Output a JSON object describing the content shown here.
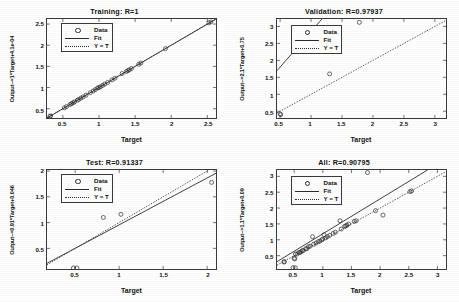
{
  "figure": {
    "background_color": "#ffffff",
    "axis_color": "#3a3a3a",
    "marker_color": "#2b2b2b"
  },
  "legend_labels": {
    "data": "Data",
    "fit": "Fit",
    "yt": "Y = T"
  },
  "chart_data": [
    {
      "type": "scatter",
      "title": "Training:  R=1",
      "xlabel": "Target",
      "ylabel": "Output~=1*Target+4.1e-04",
      "xlim": [
        0.28,
        2.62
      ],
      "ylim": [
        0.28,
        2.62
      ],
      "xticks": [
        0.5,
        1,
        1.5,
        2,
        2.5
      ],
      "xticklabels": [
        "0.5",
        "1",
        "1.5",
        "2",
        "2.5"
      ],
      "yticks": [
        0.5,
        1,
        1.5,
        2,
        2.5
      ],
      "yticklabels": [
        "0.5",
        "1",
        "1.5",
        "2",
        "2.5"
      ],
      "grid": false,
      "legend_position": "upper-left",
      "legend": [
        "Data",
        "Fit",
        "Y = T"
      ],
      "fit_line": {
        "slope": 1.0,
        "intercept": 0.00041,
        "style": "solid"
      },
      "identity_line": {
        "slope": 1.0,
        "intercept": 0.0,
        "style": "dotted"
      },
      "points": [
        [
          0.32,
          0.32
        ],
        [
          0.33,
          0.33
        ],
        [
          0.52,
          0.52
        ],
        [
          0.55,
          0.55
        ],
        [
          0.6,
          0.6
        ],
        [
          0.62,
          0.62
        ],
        [
          0.64,
          0.64
        ],
        [
          0.66,
          0.66
        ],
        [
          0.7,
          0.7
        ],
        [
          0.72,
          0.72
        ],
        [
          0.75,
          0.75
        ],
        [
          0.78,
          0.78
        ],
        [
          0.82,
          0.82
        ],
        [
          0.88,
          0.88
        ],
        [
          0.92,
          0.92
        ],
        [
          0.95,
          0.95
        ],
        [
          0.98,
          0.99
        ],
        [
          1.0,
          1.0
        ],
        [
          1.02,
          1.02
        ],
        [
          1.05,
          1.05
        ],
        [
          1.08,
          1.08
        ],
        [
          1.12,
          1.12
        ],
        [
          1.18,
          1.18
        ],
        [
          1.22,
          1.22
        ],
        [
          1.32,
          1.33
        ],
        [
          1.38,
          1.38
        ],
        [
          1.4,
          1.4
        ],
        [
          1.42,
          1.42
        ],
        [
          1.45,
          1.45
        ],
        [
          1.55,
          1.55
        ],
        [
          1.58,
          1.58
        ],
        [
          1.92,
          1.92
        ],
        [
          2.52,
          2.53
        ],
        [
          2.55,
          2.55
        ]
      ]
    },
    {
      "type": "scatter",
      "title": "Validation:  R=0.97937",
      "xlabel": "Target",
      "ylabel": "Output~=2.1*Target+0.75",
      "xlim": [
        0.45,
        3.18
      ],
      "ylim": [
        0.3,
        3.22
      ],
      "xticks": [
        0.5,
        1,
        1.5,
        2,
        2.5,
        3
      ],
      "xticklabels": [
        "0.5",
        "1",
        "1.5",
        "2",
        "2.5",
        "3"
      ],
      "yticks": [
        0.5,
        1,
        1.5,
        2,
        2.5,
        3
      ],
      "yticklabels": [
        "0.5",
        "1",
        "1.5",
        "2",
        "2.5",
        "3"
      ],
      "grid": false,
      "legend_position": "upper-left",
      "legend": [
        "Data",
        "Fit",
        "Y = T"
      ],
      "fit_line": {
        "slope": 2.1,
        "intercept": 0.75,
        "style": "solid"
      },
      "identity_line": {
        "slope": 1.0,
        "intercept": 0.0,
        "style": "dotted"
      },
      "points": [
        [
          0.5,
          0.42
        ],
        [
          0.51,
          0.4
        ],
        [
          1.3,
          1.6
        ],
        [
          1.78,
          3.12
        ]
      ]
    },
    {
      "type": "scatter",
      "title": "Test:  R=0.91337",
      "xlabel": "Target",
      "ylabel": "Output~=0.91*Target+0.046",
      "xlim": [
        0.18,
        2.1
      ],
      "ylim": [
        0.1,
        2.02
      ],
      "xticks": [
        0.5,
        1,
        1.5,
        2
      ],
      "xticklabels": [
        "0.5",
        "1",
        "1.5",
        "2"
      ],
      "yticks": [
        0.5,
        1,
        1.5,
        2
      ],
      "yticklabels": [
        "0.5",
        "1",
        "1.5",
        "2"
      ],
      "grid": false,
      "legend_position": "upper-left",
      "legend": [
        "Data",
        "Fit",
        "Y = T"
      ],
      "fit_line": {
        "slope": 0.91,
        "intercept": 0.046,
        "style": "solid"
      },
      "identity_line": {
        "slope": 1.0,
        "intercept": 0.0,
        "style": "dotted"
      },
      "points": [
        [
          0.48,
          0.12
        ],
        [
          0.52,
          0.12
        ],
        [
          0.82,
          1.1
        ],
        [
          1.02,
          1.16
        ],
        [
          2.05,
          1.78
        ]
      ]
    },
    {
      "type": "scatter",
      "title": "All:  R=0.90795",
      "xlabel": "Target",
      "ylabel": "Output~=1.1*Target+0.09",
      "xlim": [
        0.2,
        3.15
      ],
      "ylim": [
        0.08,
        3.2
      ],
      "xticks": [
        0.5,
        1,
        1.5,
        2,
        2.5,
        3
      ],
      "xticklabels": [
        "0.5",
        "1",
        "1.5",
        "2",
        "2.5",
        "3"
      ],
      "yticks": [
        0.5,
        1,
        1.5,
        2,
        2.5,
        3
      ],
      "yticklabels": [
        "0.5",
        "1",
        "1.5",
        "2",
        "2.5",
        "3"
      ],
      "grid": false,
      "legend_position": "upper-left",
      "legend": [
        "Data",
        "Fit",
        "Y = T"
      ],
      "fit_line": {
        "slope": 1.1,
        "intercept": 0.09,
        "style": "solid"
      },
      "identity_line": {
        "slope": 1.0,
        "intercept": 0.0,
        "style": "dotted"
      },
      "points": [
        [
          0.32,
          0.3
        ],
        [
          0.33,
          0.31
        ],
        [
          0.48,
          0.12
        ],
        [
          0.52,
          0.12
        ],
        [
          0.5,
          0.42
        ],
        [
          0.51,
          0.4
        ],
        [
          0.52,
          0.55
        ],
        [
          0.55,
          0.55
        ],
        [
          0.58,
          0.6
        ],
        [
          0.6,
          0.6
        ],
        [
          0.62,
          0.62
        ],
        [
          0.64,
          0.66
        ],
        [
          0.66,
          0.66
        ],
        [
          0.7,
          0.72
        ],
        [
          0.72,
          0.72
        ],
        [
          0.75,
          0.78
        ],
        [
          0.78,
          0.8
        ],
        [
          0.82,
          1.1
        ],
        [
          0.84,
          0.86
        ],
        [
          0.88,
          0.9
        ],
        [
          0.92,
          0.94
        ],
        [
          0.95,
          0.96
        ],
        [
          0.98,
          1.0
        ],
        [
          1.0,
          1.02
        ],
        [
          1.02,
          1.16
        ],
        [
          1.05,
          1.06
        ],
        [
          1.08,
          1.1
        ],
        [
          1.12,
          1.14
        ],
        [
          1.18,
          1.2
        ],
        [
          1.22,
          1.24
        ],
        [
          1.3,
          1.6
        ],
        [
          1.32,
          1.34
        ],
        [
          1.38,
          1.42
        ],
        [
          1.4,
          1.44
        ],
        [
          1.42,
          1.46
        ],
        [
          1.45,
          1.5
        ],
        [
          1.55,
          1.58
        ],
        [
          1.58,
          1.6
        ],
        [
          1.78,
          3.12
        ],
        [
          1.92,
          1.92
        ],
        [
          2.05,
          1.78
        ],
        [
          2.52,
          2.52
        ],
        [
          2.55,
          2.54
        ]
      ]
    }
  ]
}
